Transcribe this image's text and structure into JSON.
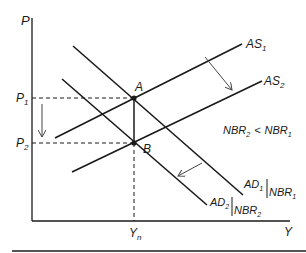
{
  "diagram": {
    "axes": {
      "y_label": "P",
      "x_label": "Y"
    },
    "price_levels": {
      "p1": {
        "main": "P",
        "sub": "1"
      },
      "p2": {
        "main": "P",
        "sub": "2"
      }
    },
    "output_level": {
      "main": "Y",
      "sub": "n"
    },
    "points": {
      "a": "A",
      "b": "B"
    },
    "curves": {
      "as1": {
        "main": "AS",
        "sub": "1"
      },
      "as2": {
        "main": "AS",
        "sub": "2"
      },
      "ad1": {
        "main": "AD",
        "sub": "1",
        "cond_main": "NBR",
        "cond_sub": "1"
      },
      "ad2": {
        "main": "AD",
        "sub": "2",
        "cond_main": "NBR",
        "cond_sub": "2"
      }
    },
    "annotation": {
      "lhs_main": "NBR",
      "lhs_sub": "2",
      "op": "<",
      "rhs_main": "NBR",
      "rhs_sub": "1"
    },
    "colors": {
      "line": "#1a1a1a",
      "arrow": "#444444",
      "rule": "#555555"
    }
  }
}
